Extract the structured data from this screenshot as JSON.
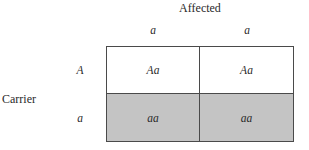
{
  "diagram": {
    "type": "punnett-square",
    "column_parent_label": "Affected",
    "row_parent_label": "Carrier",
    "column_alleles": [
      "a",
      "a"
    ],
    "row_alleles": [
      "A",
      "a"
    ],
    "cells": [
      [
        {
          "genotype": "Aa",
          "shaded": false
        },
        {
          "genotype": "Aa",
          "shaded": false
        }
      ],
      [
        {
          "genotype": "aa",
          "shaded": true
        },
        {
          "genotype": "aa",
          "shaded": true
        }
      ]
    ],
    "colors": {
      "shaded_fill": "#c4c4c4",
      "unshaded_fill": "#ffffff",
      "grid_line": "#4a4a4a"
    }
  }
}
